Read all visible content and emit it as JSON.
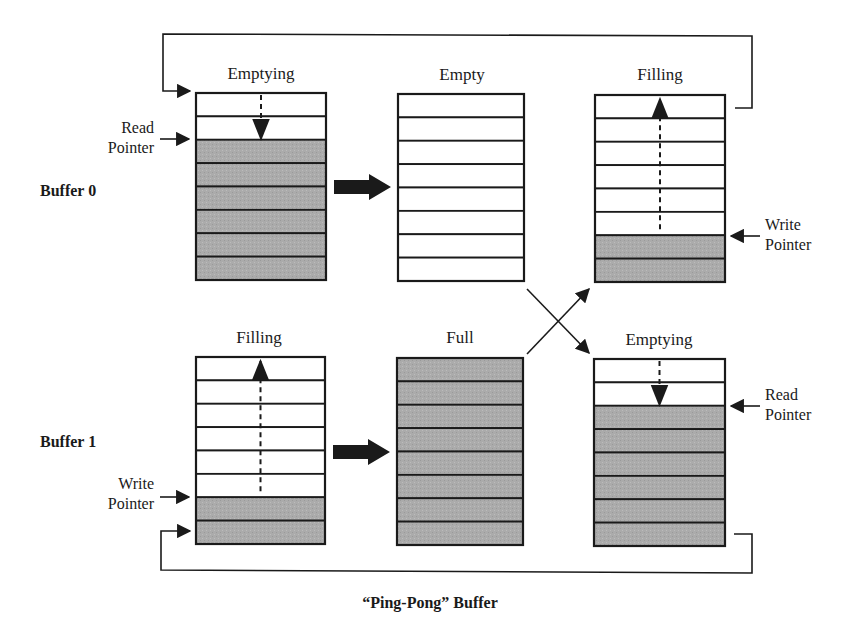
{
  "diagram": {
    "caption": "“Ping-Pong” Buffer",
    "rows": [
      {
        "label": "Buffer 0"
      },
      {
        "label": "Buffer 1"
      }
    ],
    "buffers": [
      {
        "id": "b0-emptying",
        "title": "Emptying",
        "filled": [
          false,
          false,
          true,
          true,
          true,
          true,
          true,
          true
        ],
        "pointer": "Read Pointer",
        "pointer_side": "left",
        "pointer_row": 2,
        "direction": "down"
      },
      {
        "id": "b0-empty",
        "title": "Empty",
        "filled": [
          false,
          false,
          false,
          false,
          false,
          false,
          false,
          false
        ]
      },
      {
        "id": "b0-filling",
        "title": "Filling",
        "filled": [
          false,
          false,
          false,
          false,
          false,
          false,
          true,
          true
        ],
        "pointer": "Write Pointer",
        "pointer_side": "right",
        "pointer_row": 6,
        "direction": "up"
      },
      {
        "id": "b1-filling",
        "title": "Filling",
        "filled": [
          false,
          false,
          false,
          false,
          false,
          false,
          true,
          true
        ],
        "pointer": "Write Pointer",
        "pointer_side": "left",
        "pointer_row": 6,
        "direction": "up"
      },
      {
        "id": "b1-full",
        "title": "Full",
        "filled": [
          true,
          true,
          true,
          true,
          true,
          true,
          true,
          true
        ]
      },
      {
        "id": "b1-emptying",
        "title": "Emptying",
        "filled": [
          false,
          false,
          true,
          true,
          true,
          true,
          true,
          true
        ],
        "pointer": "Read Pointer",
        "pointer_side": "right",
        "pointer_row": 2,
        "direction": "down"
      }
    ],
    "pointer_labels": {
      "read": "Read\nPointer",
      "write": "Write\nPointer"
    },
    "colors": {
      "filled": "#a9a9a9",
      "empty": "#ffffff",
      "line": "#1a1a1a"
    }
  }
}
